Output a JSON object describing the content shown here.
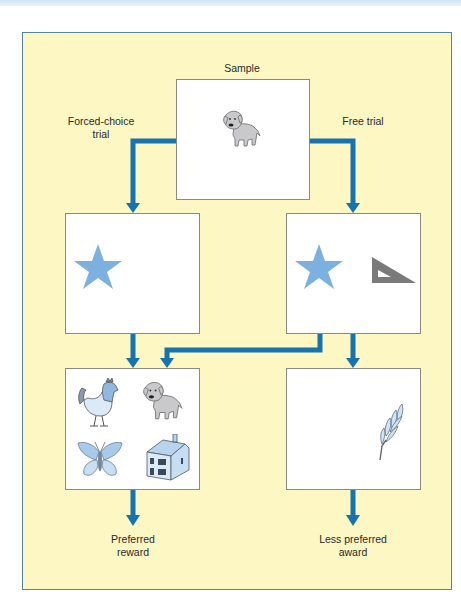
{
  "diagram": {
    "labels": {
      "sample": "Sample",
      "forced_choice": "Forced-choice\ntrial",
      "free_trial": "Free trial",
      "preferred_reward": "Preferred\nreward",
      "less_preferred": "Less preferred\naward"
    },
    "boxes": [
      {
        "id": "sample",
        "contents": [
          "dog"
        ]
      },
      {
        "id": "forced-choice-options",
        "contents": [
          "star"
        ]
      },
      {
        "id": "free-trial-options",
        "contents": [
          "star",
          "set-square"
        ]
      },
      {
        "id": "preferred-reward",
        "contents": [
          "rooster",
          "dog",
          "butterfly",
          "house"
        ]
      },
      {
        "id": "less-preferred-award",
        "contents": [
          "wheat"
        ]
      }
    ],
    "colors": {
      "background": "#fdf7c4",
      "arrow": "#1673ad",
      "star": "#7cb0de",
      "set_square": "#7a7a7a",
      "border": "#4f86a8"
    }
  }
}
